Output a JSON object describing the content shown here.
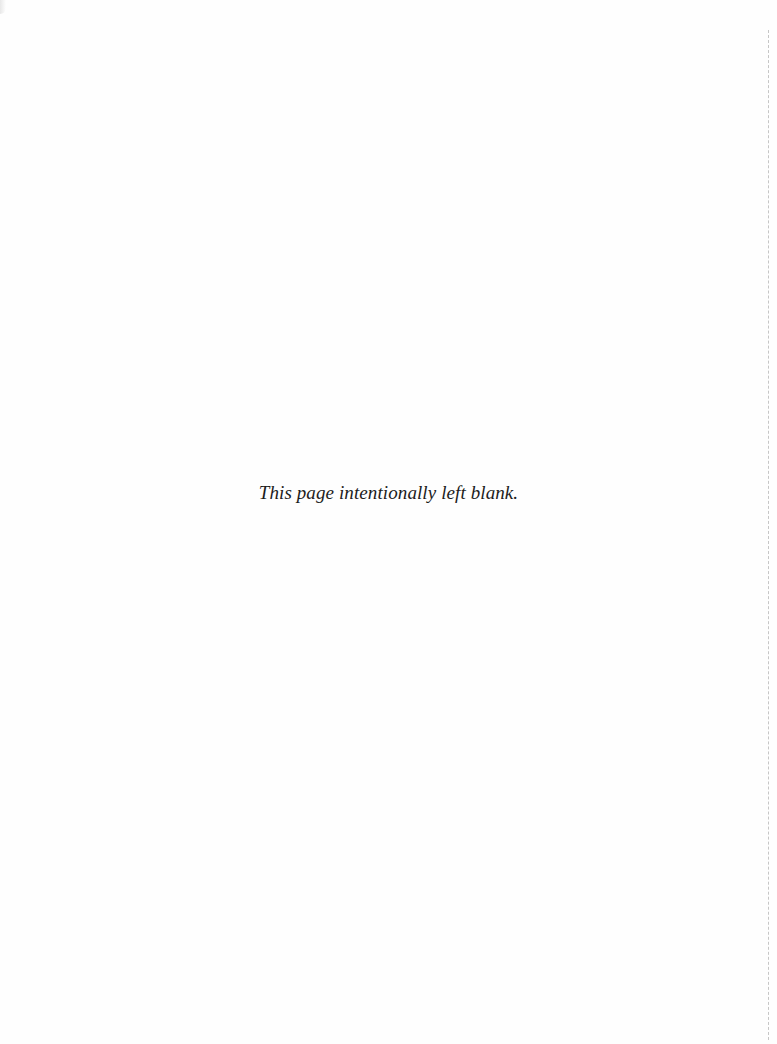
{
  "page": {
    "notice": "This page intentionally left blank.",
    "background_color": "#ffffff",
    "text_color": "#1c1c1c"
  }
}
